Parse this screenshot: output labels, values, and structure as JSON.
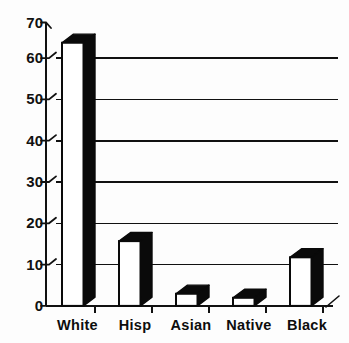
{
  "chart_data": {
    "type": "bar",
    "title": "",
    "subtitle": "",
    "xlabel": "",
    "ylabel": "",
    "categories": [
      "White",
      "Hisp",
      "Asian",
      "Native",
      "Black"
    ],
    "values": [
      65,
      16,
      3,
      2,
      12
    ],
    "series": [
      {
        "name": "",
        "values": [
          65,
          16,
          3,
          2,
          12
        ]
      }
    ],
    "ylim": [
      0,
      70
    ],
    "ytick_values": [
      0,
      10,
      20,
      30,
      40,
      50,
      60,
      70
    ],
    "ytick_labels": [
      "0",
      "10",
      "20",
      "30",
      "40",
      "50",
      "60",
      "70"
    ],
    "grid": true,
    "grid_axis": "y",
    "gridline_values": [
      10,
      20,
      30,
      40,
      50,
      60
    ],
    "legend": false,
    "legend_position": "none",
    "style": "3d-bar-monochrome",
    "bar_face_color": "#ffffff",
    "bar_edge_color": "#000000",
    "bar_shadow_color": "#000000",
    "background_color": "#ffffff",
    "axis_color": "#000000",
    "annotations": []
  },
  "axes": {
    "y_axis_name": "y-axis",
    "x_axis_name": "x-axis"
  }
}
